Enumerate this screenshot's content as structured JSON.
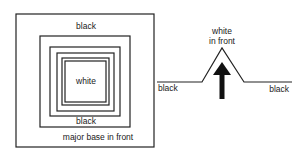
{
  "left_figure": {
    "labels": {
      "outer_top": "black",
      "center": "white",
      "inner_bottom": "black",
      "caption": "major base in front"
    }
  },
  "right_figure": {
    "labels": {
      "peak_line1": "white",
      "peak_line2": "in front",
      "left_base": "black",
      "right_base": "black"
    },
    "arrow_direction": "up"
  }
}
